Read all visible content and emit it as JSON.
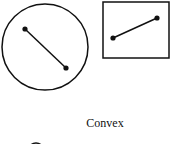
{
  "diagram": {
    "caption": "Convex",
    "stroke_color": "#111111",
    "shapes": [
      {
        "type": "circle",
        "cx": 45,
        "cy": 47,
        "r": 43,
        "segment": {
          "p1": [
            25,
            29
          ],
          "p2": [
            66,
            68
          ]
        }
      },
      {
        "type": "rectangle",
        "x": 103,
        "y": 2,
        "w": 66,
        "h": 56,
        "segment": {
          "p1": [
            113,
            38
          ],
          "p2": [
            157,
            18
          ]
        }
      },
      {
        "type": "circle-partial",
        "cx": 36,
        "cy": 150,
        "r": 8
      }
    ]
  }
}
